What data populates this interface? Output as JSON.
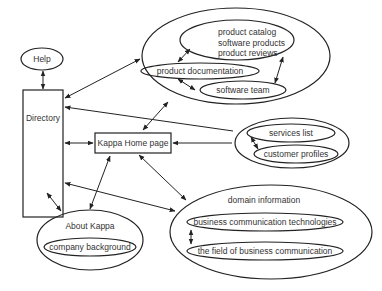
{
  "diagram": {
    "nodes": {
      "help": "Help",
      "directory": "Directory",
      "home": "Kappa Home page",
      "about": "About Kappa",
      "company_background": "company background",
      "product_catalog_line1": "product catalog",
      "product_catalog_line2": "software products",
      "product_catalog_line3": "product reviews",
      "product_documentation": "product documentation",
      "software_team": "software team",
      "services_list": "services list",
      "customer_profiles": "customer profiles",
      "domain_information": "domain information",
      "business_comm_tech": "business communication technologies",
      "field_business_comm": "the field of business communication"
    },
    "edges": [
      [
        "Help",
        "Directory"
      ],
      [
        "Directory",
        "Product group"
      ],
      [
        "Directory",
        "Services group"
      ],
      [
        "Directory",
        "Kappa Home page"
      ],
      [
        "Directory",
        "About Kappa"
      ],
      [
        "Directory",
        "Domain information group"
      ],
      [
        "Kappa Home page",
        "Product group"
      ],
      [
        "Kappa Home page",
        "Services group"
      ],
      [
        "Kappa Home page",
        "About Kappa"
      ],
      [
        "Kappa Home page",
        "Domain information group"
      ],
      [
        "product catalog",
        "product documentation"
      ],
      [
        "product documentation",
        "software team"
      ],
      [
        "software team",
        "product catalog"
      ],
      [
        "services list",
        "customer profiles"
      ],
      [
        "business communication technologies",
        "the field of business communication"
      ]
    ]
  }
}
